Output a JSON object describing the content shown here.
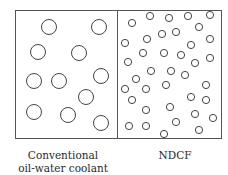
{
  "diagram": {
    "frame": {
      "x": 15,
      "y": 10,
      "width": 206,
      "height": 128,
      "divider_x": 117,
      "stroke": "#555555"
    },
    "panels": [
      {
        "name": "conventional-panel",
        "label_lines": [
          "Conventional",
          "oil-water coolant"
        ],
        "droplet_radius": 7.5,
        "droplets": [
          [
            49,
            27
          ],
          [
            99,
            27
          ],
          [
            38,
            52
          ],
          [
            79,
            53
          ],
          [
            34,
            81
          ],
          [
            59,
            81
          ],
          [
            101,
            76
          ],
          [
            86,
            97
          ],
          [
            34,
            112
          ],
          [
            68,
            115
          ],
          [
            101,
            123
          ]
        ]
      },
      {
        "name": "ndcf-panel",
        "label_lines": [
          "NDCF"
        ],
        "droplet_radius": 3.6,
        "droplets": [
          [
            132,
            23
          ],
          [
            150,
            16
          ],
          [
            169,
            18
          ],
          [
            188,
            16
          ],
          [
            210,
            15
          ],
          [
            199,
            27
          ],
          [
            176,
            32
          ],
          [
            162,
            34
          ],
          [
            147,
            39
          ],
          [
            125,
            43
          ],
          [
            210,
            39
          ],
          [
            191,
            45
          ],
          [
            143,
            53
          ],
          [
            164,
            53
          ],
          [
            181,
            55
          ],
          [
            128,
            62
          ],
          [
            210,
            58
          ],
          [
            195,
            63
          ],
          [
            151,
            71
          ],
          [
            171,
            71
          ],
          [
            185,
            75
          ],
          [
            136,
            79
          ],
          [
            125,
            89
          ],
          [
            146,
            89
          ],
          [
            166,
            85
          ],
          [
            206,
            85
          ],
          [
            132,
            100
          ],
          [
            191,
            97
          ],
          [
            206,
            100
          ],
          [
            146,
            110
          ],
          [
            170,
            107
          ],
          [
            195,
            114
          ],
          [
            213,
            118
          ],
          [
            129,
            126
          ],
          [
            146,
            126
          ],
          [
            176,
            122
          ],
          [
            164,
            134
          ],
          [
            199,
            130
          ]
        ]
      }
    ],
    "droplet_stroke": "#444444"
  }
}
